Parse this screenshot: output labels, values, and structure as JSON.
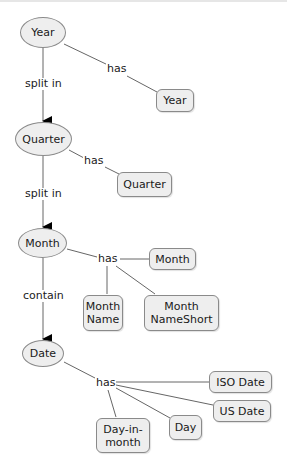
{
  "diagram": {
    "concepts": [
      {
        "id": "year",
        "label": "Year"
      },
      {
        "id": "quarter",
        "label": "Quarter"
      },
      {
        "id": "month",
        "label": "Month"
      },
      {
        "id": "date",
        "label": "Date"
      }
    ],
    "attributes": {
      "year": [
        "Year"
      ],
      "quarter": [
        "Quarter"
      ],
      "month": [
        "Month",
        "Month\nName",
        "Month\nNameShort"
      ],
      "date": [
        "ISO Date",
        "US Date",
        "Day",
        "Day-in-\nmonth"
      ]
    },
    "links": {
      "year_quarter": "split in",
      "quarter_month": "split in",
      "month_date": "contain",
      "year_has": "has",
      "quarter_has": "has",
      "month_has": "has",
      "date_has": "has"
    },
    "colors": {
      "node_fill": "#eeeeee",
      "node_border": "#8a8a8a",
      "line": "#666666",
      "arrow": "#000000"
    }
  }
}
